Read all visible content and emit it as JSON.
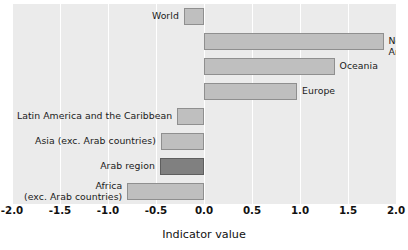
{
  "chart_data": {
    "type": "bar",
    "orientation": "horizontal",
    "title": "",
    "xlabel": "Indicator value",
    "ylabel": "",
    "xlim": [
      -2.0,
      2.0
    ],
    "xticks": [
      "-2.0",
      "-1.5",
      "-1.0",
      "-0.5",
      "0.0",
      "0.5",
      "1.0",
      "1.5",
      "2.0"
    ],
    "xtick_values": [
      -2.0,
      -1.5,
      -1.0,
      -0.5,
      0.0,
      0.5,
      1.0,
      1.5,
      2.0
    ],
    "grid": true,
    "grid_color": "#ffffff",
    "legend": "none",
    "panel_background": "#ebebeb",
    "bar_color": "#bfbfbf",
    "bar_edge_color": "#8f8f8f",
    "highlight_color": "#808080",
    "highlight_edge_color": "#5e5e5e",
    "categories": [
      "World",
      "North America",
      "Oceania",
      "Europe",
      "Latin America and the Caribbean",
      "Asia (exc. Arab countries)",
      "Arab region",
      "Africa\n(exc. Arab countries)"
    ],
    "values": [
      -0.21,
      1.87,
      1.36,
      0.97,
      -0.28,
      -0.45,
      -0.46,
      -0.8
    ],
    "highlighted": [
      "Arab region"
    ]
  },
  "bars": [
    {
      "label": "World",
      "value": -0.21,
      "label_side": "left",
      "highlight": false
    },
    {
      "label": "North America",
      "value": 1.87,
      "label_side": "right",
      "highlight": false
    },
    {
      "label": "Oceania",
      "value": 1.36,
      "label_side": "right",
      "highlight": false
    },
    {
      "label": "Europe",
      "value": 0.97,
      "label_side": "right",
      "highlight": false
    },
    {
      "label": "Latin America and the Caribbean",
      "value": -0.28,
      "label_side": "left",
      "highlight": false
    },
    {
      "label": "Asia (exc. Arab countries)",
      "value": -0.45,
      "label_side": "left",
      "highlight": false
    },
    {
      "label": "Arab region",
      "value": -0.46,
      "label_side": "left",
      "highlight": true
    },
    {
      "label": "Africa\n(exc. Arab countries)",
      "value": -0.8,
      "label_side": "left",
      "highlight": false
    }
  ],
  "axis": {
    "title": "Indicator value",
    "ticks": [
      "-2.0",
      "-1.5",
      "-1.0",
      "-0.5",
      "0.0",
      "0.5",
      "1.0",
      "1.5",
      "2.0"
    ]
  }
}
